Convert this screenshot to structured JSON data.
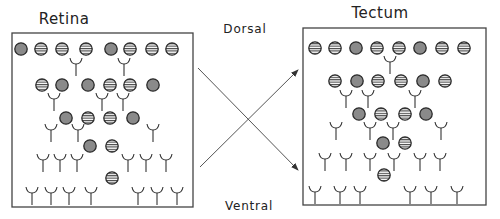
{
  "labels": {
    "retina": {
      "text": "Retina",
      "x": 64,
      "y": 10
    },
    "tectum": {
      "text": "Tectum",
      "x": 380,
      "y": 4
    },
    "dorsal": {
      "text": "Dorsal",
      "x": 245,
      "y": 22
    },
    "ventral": {
      "text": "Ventral",
      "x": 249,
      "y": 199
    }
  },
  "colors": {
    "stroke": "#333333",
    "box": "#444444",
    "fill_solid": "#8a8a8a",
    "fill_striped": "#ffffff",
    "stripe": "#444444",
    "arrow": "#555555"
  },
  "panels": {
    "retina": {
      "box": {
        "x": 12,
        "y": 33,
        "w": 181,
        "h": 174
      },
      "cells": [
        {
          "x": 21,
          "y": 49,
          "s": "solid"
        },
        {
          "x": 41,
          "y": 49,
          "s": "striped"
        },
        {
          "x": 62,
          "y": 49,
          "s": "striped"
        },
        {
          "x": 86,
          "y": 49,
          "s": "striped"
        },
        {
          "x": 111,
          "y": 49,
          "s": "solid"
        },
        {
          "x": 130,
          "y": 49,
          "s": "striped"
        },
        {
          "x": 152,
          "y": 49,
          "s": "striped"
        },
        {
          "x": 172,
          "y": 49,
          "s": "striped"
        },
        {
          "x": 42,
          "y": 85,
          "s": "striped"
        },
        {
          "x": 62,
          "y": 85,
          "s": "solid"
        },
        {
          "x": 88,
          "y": 85,
          "s": "solid"
        },
        {
          "x": 110,
          "y": 85,
          "s": "striped"
        },
        {
          "x": 130,
          "y": 85,
          "s": "striped"
        },
        {
          "x": 153,
          "y": 85,
          "s": "solid"
        },
        {
          "x": 66,
          "y": 118,
          "s": "solid"
        },
        {
          "x": 88,
          "y": 118,
          "s": "striped"
        },
        {
          "x": 110,
          "y": 118,
          "s": "striped"
        },
        {
          "x": 133,
          "y": 118,
          "s": "solid"
        },
        {
          "x": 90,
          "y": 146,
          "s": "solid"
        },
        {
          "x": 112,
          "y": 146,
          "s": "striped"
        },
        {
          "x": 112,
          "y": 178,
          "s": "striped"
        }
      ],
      "receptors": [
        {
          "x": 76,
          "y": 58,
          "h": 18
        },
        {
          "x": 124,
          "y": 58,
          "h": 18
        },
        {
          "x": 54,
          "y": 93,
          "h": 18
        },
        {
          "x": 102,
          "y": 93,
          "h": 18
        },
        {
          "x": 123,
          "y": 93,
          "h": 18
        },
        {
          "x": 51,
          "y": 124,
          "h": 18
        },
        {
          "x": 78,
          "y": 124,
          "h": 18
        },
        {
          "x": 153,
          "y": 124,
          "h": 18
        },
        {
          "x": 43,
          "y": 154,
          "h": 18
        },
        {
          "x": 60,
          "y": 154,
          "h": 18
        },
        {
          "x": 77,
          "y": 154,
          "h": 18
        },
        {
          "x": 128,
          "y": 154,
          "h": 18
        },
        {
          "x": 146,
          "y": 154,
          "h": 18
        },
        {
          "x": 166,
          "y": 154,
          "h": 18
        },
        {
          "x": 32,
          "y": 187,
          "h": 18
        },
        {
          "x": 51,
          "y": 187,
          "h": 18
        },
        {
          "x": 69,
          "y": 187,
          "h": 18
        },
        {
          "x": 91,
          "y": 187,
          "h": 18
        },
        {
          "x": 138,
          "y": 187,
          "h": 18
        },
        {
          "x": 157,
          "y": 187,
          "h": 18
        },
        {
          "x": 177,
          "y": 187,
          "h": 18
        }
      ]
    },
    "tectum": {
      "box": {
        "x": 303,
        "y": 28,
        "w": 183,
        "h": 177
      },
      "cells": [
        {
          "x": 315,
          "y": 48,
          "s": "striped"
        },
        {
          "x": 335,
          "y": 48,
          "s": "striped"
        },
        {
          "x": 356,
          "y": 48,
          "s": "solid"
        },
        {
          "x": 377,
          "y": 48,
          "s": "striped"
        },
        {
          "x": 399,
          "y": 48,
          "s": "striped"
        },
        {
          "x": 420,
          "y": 48,
          "s": "solid"
        },
        {
          "x": 442,
          "y": 48,
          "s": "striped"
        },
        {
          "x": 464,
          "y": 48,
          "s": "striped"
        },
        {
          "x": 335,
          "y": 81,
          "s": "striped"
        },
        {
          "x": 357,
          "y": 81,
          "s": "solid"
        },
        {
          "x": 378,
          "y": 81,
          "s": "striped"
        },
        {
          "x": 401,
          "y": 81,
          "s": "striped"
        },
        {
          "x": 423,
          "y": 81,
          "s": "solid"
        },
        {
          "x": 445,
          "y": 81,
          "s": "striped"
        },
        {
          "x": 359,
          "y": 114,
          "s": "solid"
        },
        {
          "x": 381,
          "y": 114,
          "s": "striped"
        },
        {
          "x": 405,
          "y": 114,
          "s": "striped"
        },
        {
          "x": 426,
          "y": 114,
          "s": "solid"
        },
        {
          "x": 383,
          "y": 143,
          "s": "solid"
        },
        {
          "x": 405,
          "y": 143,
          "s": "striped"
        },
        {
          "x": 384,
          "y": 175,
          "s": "striped"
        }
      ],
      "receptors": [
        {
          "x": 390,
          "y": 56,
          "h": 18
        },
        {
          "x": 346,
          "y": 90,
          "h": 18
        },
        {
          "x": 368,
          "y": 90,
          "h": 18
        },
        {
          "x": 415,
          "y": 90,
          "h": 18
        },
        {
          "x": 336,
          "y": 122,
          "h": 18
        },
        {
          "x": 370,
          "y": 122,
          "h": 18
        },
        {
          "x": 393,
          "y": 122,
          "h": 18
        },
        {
          "x": 441,
          "y": 122,
          "h": 18
        },
        {
          "x": 325,
          "y": 153,
          "h": 18
        },
        {
          "x": 346,
          "y": 153,
          "h": 18
        },
        {
          "x": 370,
          "y": 153,
          "h": 18
        },
        {
          "x": 394,
          "y": 153,
          "h": 18
        },
        {
          "x": 420,
          "y": 153,
          "h": 18
        },
        {
          "x": 440,
          "y": 153,
          "h": 18
        },
        {
          "x": 315,
          "y": 186,
          "h": 18
        },
        {
          "x": 340,
          "y": 186,
          "h": 18
        },
        {
          "x": 360,
          "y": 186,
          "h": 18
        },
        {
          "x": 410,
          "y": 186,
          "h": 18
        },
        {
          "x": 431,
          "y": 186,
          "h": 18
        },
        {
          "x": 457,
          "y": 186,
          "h": 18
        }
      ]
    }
  },
  "arrows": [
    {
      "name": "dorsal-to-ventral-arrow",
      "x1": 198,
      "y1": 68,
      "x2": 298,
      "y2": 170
    },
    {
      "name": "ventral-to-dorsal-arrow",
      "x1": 200,
      "y1": 167,
      "x2": 298,
      "y2": 70
    }
  ]
}
